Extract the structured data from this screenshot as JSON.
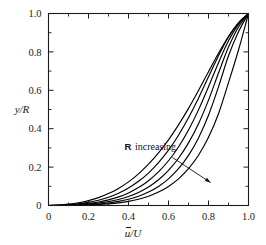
{
  "chart_data": {
    "type": "line",
    "title": "",
    "xlabel": "ū/U",
    "ylabel": "y/R",
    "xlim": [
      0,
      1
    ],
    "ylim": [
      0,
      1
    ],
    "grid": false,
    "legend_position": "none",
    "xticks": [
      "0",
      "0.2",
      "0.4",
      "0.6",
      "0.8",
      "1.0"
    ],
    "xtick_values": [
      0,
      0.2,
      0.4,
      0.6,
      0.8,
      1.0
    ],
    "yticks": [
      "0",
      "0.2",
      "0.4",
      "0.6",
      "0.8",
      "1.0"
    ],
    "ytick_values": [
      0,
      0.2,
      0.4,
      0.6,
      0.8,
      1.0
    ],
    "minor_tick_interval": 0.1,
    "annotations": [
      {
        "name": "r-increasing",
        "symbol": "R",
        "text": "increasing",
        "x": 0.38,
        "y": 0.29,
        "arrow_from": [
          0.62,
          0.25
        ],
        "arrow_to": [
          0.81,
          0.12
        ]
      }
    ],
    "series": [
      {
        "name": "R = 1 (lowest)",
        "x": [
          0,
          0.05,
          0.1,
          0.15,
          0.2,
          0.25,
          0.3,
          0.35,
          0.4,
          0.45,
          0.5,
          0.55,
          0.6,
          0.65,
          0.7,
          0.75,
          0.8,
          0.85,
          0.9,
          0.95,
          1.0
        ],
        "y": [
          0,
          0.0002,
          0.0006,
          0.0014,
          0.0028,
          0.005,
          0.0085,
          0.0138,
          0.0216,
          0.0328,
          0.0484,
          0.07,
          0.0994,
          0.139,
          0.192,
          0.262,
          0.355,
          0.478,
          0.64,
          0.81,
          1.0
        ]
      },
      {
        "name": "R = 2",
        "x": [
          0,
          0.05,
          0.1,
          0.15,
          0.2,
          0.25,
          0.3,
          0.35,
          0.4,
          0.45,
          0.5,
          0.55,
          0.6,
          0.65,
          0.7,
          0.75,
          0.8,
          0.85,
          0.9,
          0.95,
          1.0
        ],
        "y": [
          0,
          0.0003,
          0.001,
          0.0023,
          0.0045,
          0.008,
          0.0133,
          0.0212,
          0.0325,
          0.0483,
          0.07,
          0.0995,
          0.139,
          0.1915,
          0.261,
          0.352,
          0.47,
          0.618,
          0.78,
          0.905,
          1.0
        ]
      },
      {
        "name": "R = 3",
        "x": [
          0,
          0.05,
          0.1,
          0.15,
          0.2,
          0.25,
          0.3,
          0.35,
          0.4,
          0.45,
          0.5,
          0.55,
          0.6,
          0.65,
          0.7,
          0.75,
          0.8,
          0.85,
          0.9,
          0.95,
          1.0
        ],
        "y": [
          0,
          0.0005,
          0.0016,
          0.0036,
          0.007,
          0.0122,
          0.02,
          0.0312,
          0.0468,
          0.068,
          0.0964,
          0.134,
          0.183,
          0.246,
          0.326,
          0.426,
          0.549,
          0.69,
          0.825,
          0.93,
          1.0
        ]
      },
      {
        "name": "R = 4",
        "x": [
          0,
          0.05,
          0.1,
          0.15,
          0.2,
          0.25,
          0.3,
          0.35,
          0.4,
          0.45,
          0.5,
          0.55,
          0.6,
          0.65,
          0.7,
          0.75,
          0.8,
          0.85,
          0.9,
          0.95,
          1.0
        ],
        "y": [
          0,
          0.0008,
          0.0026,
          0.0057,
          0.0108,
          0.0184,
          0.0294,
          0.0448,
          0.0656,
          0.0932,
          0.129,
          0.175,
          0.233,
          0.305,
          0.393,
          0.498,
          0.618,
          0.744,
          0.858,
          0.943,
          1.0
        ]
      },
      {
        "name": "R = 5",
        "x": [
          0,
          0.05,
          0.1,
          0.15,
          0.2,
          0.25,
          0.3,
          0.35,
          0.4,
          0.45,
          0.5,
          0.55,
          0.6,
          0.65,
          0.7,
          0.75,
          0.8,
          0.85,
          0.9,
          0.95,
          1.0
        ],
        "y": [
          0,
          0.0013,
          0.0042,
          0.009,
          0.0166,
          0.0276,
          0.043,
          0.0638,
          0.091,
          0.126,
          0.169,
          0.223,
          0.288,
          0.366,
          0.457,
          0.559,
          0.67,
          0.78,
          0.878,
          0.951,
          1.0
        ]
      },
      {
        "name": "R = 6 (highest)",
        "x": [
          0,
          0.05,
          0.1,
          0.15,
          0.2,
          0.25,
          0.3,
          0.35,
          0.4,
          0.45,
          0.5,
          0.55,
          0.6,
          0.65,
          0.7,
          0.75,
          0.8,
          0.85,
          0.9,
          0.95,
          1.0
        ],
        "y": [
          0,
          0.0022,
          0.0068,
          0.0142,
          0.0254,
          0.041,
          0.062,
          0.089,
          0.123,
          0.165,
          0.215,
          0.274,
          0.342,
          0.42,
          0.506,
          0.599,
          0.697,
          0.793,
          0.88,
          0.951,
          1.0
        ]
      }
    ]
  }
}
